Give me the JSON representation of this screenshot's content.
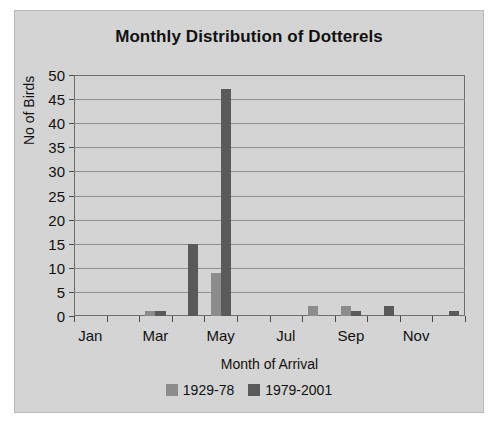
{
  "chart_data": {
    "type": "bar",
    "title": "Monthly Distribution of Dotterels",
    "xlabel": "Month of Arrival",
    "ylabel": "No of Birds",
    "categories": [
      "Jan",
      "Feb",
      "Mar",
      "Apr",
      "May",
      "Jun",
      "Jul",
      "Aug",
      "Sep",
      "Oct",
      "Nov",
      "Dec"
    ],
    "tick_labels": [
      "Jan",
      "",
      "Mar",
      "",
      "May",
      "",
      "Jul",
      "",
      "Sep",
      "",
      "Nov",
      ""
    ],
    "series": [
      {
        "name": "1929-78",
        "color": "#8c8c8c",
        "values": [
          0,
          0,
          1,
          0,
          9,
          0,
          0,
          2,
          2,
          0,
          0,
          0
        ]
      },
      {
        "name": "1979-2001",
        "color": "#5a5a5a",
        "values": [
          0,
          0,
          1,
          15,
          47,
          0,
          0,
          0,
          1,
          2,
          0,
          1
        ]
      }
    ],
    "ylim": [
      0,
      50
    ],
    "yticks": [
      0,
      5,
      10,
      15,
      20,
      25,
      30,
      35,
      40,
      45,
      50
    ],
    "grid": "horizontal",
    "legend_position": "bottom"
  },
  "colors": {
    "background": "#d4d4d4",
    "series_1929_78": "#8c8c8c",
    "series_1979_2001": "#5a5a5a",
    "axis": "#6e6e6e",
    "gridline": "#8f8f8f",
    "text": "#111111"
  }
}
